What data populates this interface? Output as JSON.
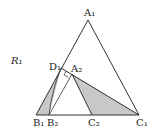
{
  "diagram": {
    "region_label": "R₁",
    "points": {
      "A1": {
        "label": "A₁",
        "x": 88,
        "y": 20
      },
      "B1": {
        "label": "B₁",
        "x": 36,
        "y": 115
      },
      "C1": {
        "label": "C₁",
        "x": 139,
        "y": 115
      },
      "B2": {
        "label": "B₂",
        "x": 49,
        "y": 115
      },
      "C2": {
        "label": "C₂",
        "x": 92,
        "y": 115
      },
      "D1": {
        "label": "D₁",
        "x": 61,
        "y": 68
      },
      "A2": {
        "label": "A₂",
        "x": 72,
        "y": 74
      }
    },
    "fill_color": "#c8c8c8",
    "line_color": "#333333"
  }
}
